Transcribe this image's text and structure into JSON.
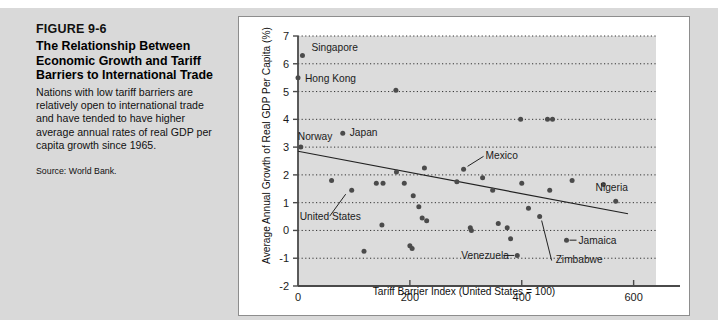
{
  "caption": {
    "figure_number": "FIGURE 9-6",
    "title": "The Relationship Between Economic Growth and Tariff Barriers to International Trade",
    "description": "Nations with low tariff barriers are relatively open to international trade and have tended to have higher average annual rates of real GDP per capita growth since 1965.",
    "source": "Source: World Bank."
  },
  "colors": {
    "paper_background": "#d9d9d9",
    "panel_background": "#ffffff",
    "plot_background": "#dcdcdc",
    "axis": "#4a4a4a",
    "gridline": "#333333",
    "point": "#4b4b4b",
    "trendline": "#222222",
    "text": "#1b1b1b"
  },
  "chart_data": {
    "type": "scatter",
    "title": "",
    "xlabel": "Tariff Barrier Index (United States = 100)",
    "ylabel": "Average Annual Growth of Real GDP Per Capita (%)",
    "xlim": [
      0,
      640
    ],
    "ylim": [
      -2,
      7
    ],
    "xticks": [
      0,
      200,
      400,
      600
    ],
    "xtick_labels": [
      "0",
      "200",
      "400",
      "600"
    ],
    "yticks": [
      -2,
      -1,
      0,
      1,
      2,
      3,
      4,
      5,
      6,
      7
    ],
    "ytick_labels": [
      "-2",
      "-1",
      "0",
      "1",
      "2",
      "3",
      "4",
      "5",
      "6",
      "7"
    ],
    "grid": "horizontal-dotted",
    "legend": "none",
    "points": [
      {
        "x": 8,
        "y": 6.3,
        "label": "Singapore"
      },
      {
        "x": 0,
        "y": 5.5,
        "label": "Hong Kong"
      },
      {
        "x": 175,
        "y": 5.05,
        "label": ""
      },
      {
        "x": 80,
        "y": 3.5,
        "label": "Japan"
      },
      {
        "x": 5,
        "y": 3.0,
        "label": "Norway"
      },
      {
        "x": 398,
        "y": 4.0,
        "label": ""
      },
      {
        "x": 446,
        "y": 4.0,
        "label": ""
      },
      {
        "x": 455,
        "y": 4.0,
        "label": ""
      },
      {
        "x": 60,
        "y": 1.8,
        "label": ""
      },
      {
        "x": 96,
        "y": 1.45,
        "label": "United States"
      },
      {
        "x": 140,
        "y": 1.7,
        "label": ""
      },
      {
        "x": 152,
        "y": 1.7,
        "label": ""
      },
      {
        "x": 176,
        "y": 2.1,
        "label": ""
      },
      {
        "x": 190,
        "y": 1.7,
        "label": ""
      },
      {
        "x": 206,
        "y": 1.25,
        "label": ""
      },
      {
        "x": 226,
        "y": 2.25,
        "label": ""
      },
      {
        "x": 216,
        "y": 0.85,
        "label": ""
      },
      {
        "x": 222,
        "y": 0.45,
        "label": ""
      },
      {
        "x": 230,
        "y": 0.35,
        "label": ""
      },
      {
        "x": 150,
        "y": 0.2,
        "label": ""
      },
      {
        "x": 118,
        "y": -0.75,
        "label": ""
      },
      {
        "x": 200,
        "y": -0.55,
        "label": ""
      },
      {
        "x": 204,
        "y": -0.65,
        "label": ""
      },
      {
        "x": 284,
        "y": 1.75,
        "label": ""
      },
      {
        "x": 296,
        "y": 2.2,
        "label": "Mexico"
      },
      {
        "x": 308,
        "y": 0.1,
        "label": ""
      },
      {
        "x": 310,
        "y": 0.0,
        "label": ""
      },
      {
        "x": 330,
        "y": 1.9,
        "label": ""
      },
      {
        "x": 348,
        "y": 1.45,
        "label": ""
      },
      {
        "x": 358,
        "y": 0.25,
        "label": ""
      },
      {
        "x": 374,
        "y": 0.1,
        "label": ""
      },
      {
        "x": 380,
        "y": -0.3,
        "label": ""
      },
      {
        "x": 392,
        "y": -0.9,
        "label": "Venezuela"
      },
      {
        "x": 400,
        "y": 1.7,
        "label": ""
      },
      {
        "x": 412,
        "y": 0.8,
        "label": ""
      },
      {
        "x": 432,
        "y": 0.5,
        "label": "Zimbabwe"
      },
      {
        "x": 450,
        "y": 1.45,
        "label": ""
      },
      {
        "x": 480,
        "y": -0.35,
        "label": "Jamaica"
      },
      {
        "x": 490,
        "y": 1.8,
        "label": ""
      },
      {
        "x": 546,
        "y": 1.65,
        "label": ""
      },
      {
        "x": 568,
        "y": 1.05,
        "label": "Nigeria"
      }
    ],
    "trendline": {
      "x0": 0,
      "y0": 2.85,
      "x1": 590,
      "y1": 0.6
    },
    "annotations": [
      {
        "text": "Singapore",
        "x": 8,
        "y": 6.3
      },
      {
        "text": "Hong Kong",
        "x": 0,
        "y": 5.5
      },
      {
        "text": "Japan",
        "x": 80,
        "y": 3.5
      },
      {
        "text": "Norway",
        "x": 5,
        "y": 3.0
      },
      {
        "text": "United States",
        "x": 96,
        "y": 1.45
      },
      {
        "text": "Mexico",
        "x": 296,
        "y": 2.2
      },
      {
        "text": "Venezuela",
        "x": 392,
        "y": -0.9
      },
      {
        "text": "Zimbabwe",
        "x": 432,
        "y": 0.5
      },
      {
        "text": "Jamaica",
        "x": 480,
        "y": -0.35
      },
      {
        "text": "Nigeria",
        "x": 568,
        "y": 1.05
      }
    ]
  }
}
